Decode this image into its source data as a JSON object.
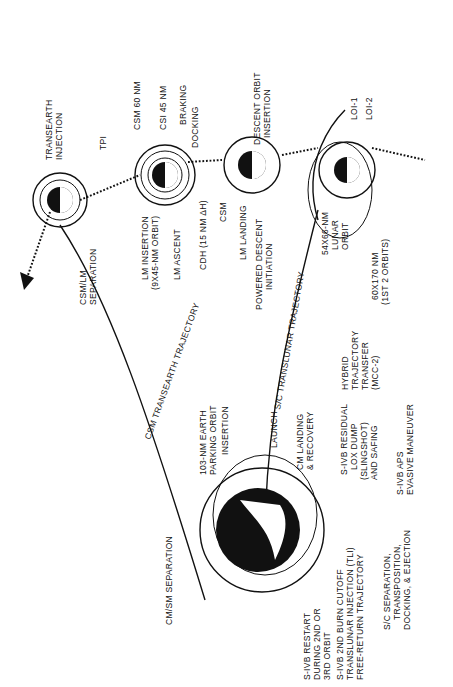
{
  "diagram": {
    "type": "mission-profile",
    "orientation": "rotated-90",
    "bodies": [
      "earth",
      "moon-transearth",
      "moon-rendezvous",
      "moon-descent",
      "moon-loi"
    ],
    "labels": {
      "transearth_injection": [
        "TRANSEARTH",
        "INJECTION"
      ],
      "csm_lm_separation": [
        "CSM/LM",
        "SEPARATION"
      ],
      "tpi": "TPI",
      "csm_60": "CSM 60 NM",
      "csi_45": "CSI 45 NM",
      "braking": "BRAKING",
      "docking": "DOCKING",
      "lm_insertion": [
        "LM INSERTION",
        "(9X45-NM ORBIT)"
      ],
      "lm_ascent": "LM ASCENT",
      "cdh": "CDH (15 NM ΔH)",
      "descent_orbit_insertion": [
        "DESCENT ORBIT",
        "INSERTION"
      ],
      "csm": "CSM",
      "lm_landing": "LM LANDING",
      "powered_descent": [
        "POWERED DESCENT",
        "INITIATION"
      ],
      "loi_1": "LOI-1",
      "loi_2": "LOI-2",
      "lunar_orbit": [
        "54X66-NM",
        "LUNAR",
        "ORBIT"
      ],
      "orbit_60x170": [
        "60X170 NM",
        "(1ST 2 ORBITS)"
      ],
      "csm_transearth": "CSM TRANSEARTH TRAJECTORY",
      "sc_translunar": "S/C TRANSLUNAR TRAJECTORY",
      "hybrid": [
        "HYBRID",
        "TRAJECTORY",
        "TRANSFER",
        "(MCC-2)"
      ],
      "parking_orbit": [
        "103-NM EARTH",
        "PARKING ORBIT"
      ],
      "insertion": "INSERTION",
      "launch": "LAUNCH",
      "cm_landing": [
        "CM LANDING",
        "& RECOVERY"
      ],
      "sivb_residual": [
        "S-IVB RESIDUAL",
        "LOX DUMP",
        "(SLINGSHOT)",
        "AND SAFING"
      ],
      "sivb_aps": [
        "S-IVB APS",
        "EVASIVE MANEUVER"
      ],
      "cm_sm_separation": "CM/SM SEPARATION",
      "sivb_restart": [
        "S-IVB RESTART",
        "DURING 2ND OR",
        "3RD ORBIT"
      ],
      "sivb_cutoff": [
        "S-IVB 2ND BURN CUTOFF",
        "TRANSLUNAR INJECTION (TLI)",
        "FREE-RETURN TRAJECTORY"
      ],
      "sc_separation": [
        "S/C SEPARATION,",
        "TRANSPOSITION,",
        "DOCKING, & EJECTION"
      ]
    }
  }
}
